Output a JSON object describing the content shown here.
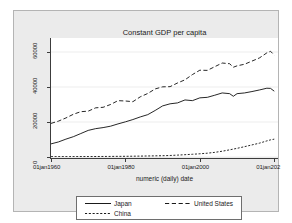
{
  "chart_data": {
    "type": "line",
    "title": "Constant GDP per capita",
    "xlabel": "numeric (daily) date",
    "ylabel": "",
    "grid": true,
    "legend_position": "bottom",
    "xlim": [
      1960,
      2021
    ],
    "ylim": [
      0,
      68000
    ],
    "ytick_labels": [
      "0",
      "20000",
      "40000",
      "60000"
    ],
    "ytick_values": [
      0,
      20000,
      40000,
      60000
    ],
    "xtick_labels": [
      "01jan1960",
      "01jan1980",
      "01jan2000",
      "01jan202"
    ],
    "xtick_values": [
      1960,
      1980,
      2000,
      2020
    ],
    "series": [
      {
        "name": "Japan",
        "style": "solid",
        "color": "#000000",
        "x": [
          1960,
          1962,
          1964,
          1966,
          1968,
          1970,
          1972,
          1974,
          1976,
          1978,
          1980,
          1982,
          1984,
          1986,
          1988,
          1990,
          1992,
          1994,
          1996,
          1998,
          2000,
          2002,
          2004,
          2006,
          2008,
          2009,
          2010,
          2012,
          2014,
          2016,
          2018,
          2019,
          2020
        ],
        "values": [
          7500,
          8600,
          10200,
          11600,
          13400,
          15200,
          16200,
          16800,
          17600,
          18900,
          20100,
          21400,
          22900,
          24200,
          26600,
          29200,
          30400,
          30900,
          32600,
          32200,
          33800,
          34100,
          35300,
          36600,
          36200,
          34700,
          36200,
          36600,
          37400,
          38300,
          39300,
          39200,
          37600
        ]
      },
      {
        "name": "United States",
        "style": "dashed",
        "color": "#000000",
        "x": [
          1960,
          1962,
          1964,
          1966,
          1968,
          1970,
          1972,
          1974,
          1976,
          1978,
          1980,
          1982,
          1984,
          1986,
          1988,
          1990,
          1992,
          1994,
          1996,
          1998,
          2000,
          2002,
          2004,
          2006,
          2008,
          2009,
          2010,
          2012,
          2014,
          2016,
          2018,
          2019,
          2020
        ],
        "values": [
          19200,
          20500,
          22300,
          24400,
          25900,
          26200,
          28100,
          28400,
          30000,
          32200,
          32000,
          31600,
          34400,
          36300,
          38900,
          40100,
          40200,
          42300,
          44100,
          47100,
          49600,
          49500,
          51600,
          53700,
          53300,
          51300,
          52100,
          53000,
          54800,
          56600,
          59500,
          60400,
          58200
        ]
      },
      {
        "name": "China",
        "style": "dotted",
        "color": "#000000",
        "x": [
          1960,
          1965,
          1970,
          1975,
          1980,
          1985,
          1990,
          1992,
          1994,
          1996,
          1998,
          2000,
          2002,
          2004,
          2006,
          2008,
          2010,
          2012,
          2014,
          2016,
          2018,
          2019,
          2020
        ],
        "values": [
          200,
          220,
          260,
          320,
          400,
          550,
          740,
          870,
          1080,
          1320,
          1560,
          1840,
          2180,
          2650,
          3300,
          4100,
          4950,
          5900,
          6900,
          7900,
          9200,
          9800,
          10200
        ]
      }
    ]
  },
  "legend": {
    "japan_label": "Japan",
    "us_label": "United States",
    "china_label": "China"
  }
}
